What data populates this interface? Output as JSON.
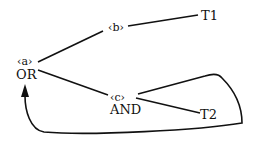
{
  "nodes": {
    "a": {
      "tag": "‹a›",
      "label": "OR"
    },
    "b": {
      "tag": "‹b›"
    },
    "c": {
      "tag": "‹c›",
      "label": "AND"
    },
    "t1": {
      "label": "T1"
    },
    "t2": {
      "label": "T2"
    }
  },
  "edges": [
    {
      "from": "a",
      "to": "b"
    },
    {
      "from": "b",
      "to": "t1"
    },
    {
      "from": "a",
      "to": "c"
    },
    {
      "from": "c",
      "to": "t2"
    },
    {
      "from": "c",
      "to": "a",
      "style": "loop-arrow"
    }
  ]
}
